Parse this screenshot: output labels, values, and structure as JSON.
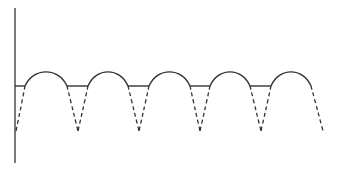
{
  "figure": {
    "colors": {
      "stroke": "#333333",
      "background": "#ffffff"
    },
    "axis": {
      "x": 15,
      "y_top": 8,
      "y_bottom": 163
    },
    "baseline_y": 86,
    "peak_y": 72,
    "cusp_y": 131,
    "arches": [
      {
        "x1": 25,
        "x2": 67
      },
      {
        "x1": 88,
        "x2": 128
      },
      {
        "x1": 149,
        "x2": 190
      },
      {
        "x1": 210,
        "x2": 250
      },
      {
        "x1": 271,
        "x2": 311
      }
    ],
    "flats": [
      {
        "x1": 15,
        "x2": 25
      },
      {
        "x1": 67,
        "x2": 88
      },
      {
        "x1": 128,
        "x2": 149
      },
      {
        "x1": 190,
        "x2": 210
      },
      {
        "x1": 250,
        "x2": 271
      }
    ],
    "cusps_x": [
      16,
      78,
      139,
      200,
      261,
      323
    ]
  }
}
